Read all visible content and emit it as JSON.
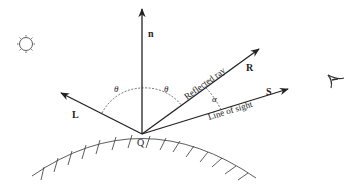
{
  "figure": {
    "labels": {
      "normal": "n",
      "light": "L",
      "reflected": "R",
      "sight": "S",
      "point": "Q",
      "theta_left": "θ",
      "theta_right": "θ",
      "alpha": "α",
      "reflected_ray_text": "Reflected ray",
      "line_of_sight_text": "Line of sight"
    },
    "icons": {
      "light_source": "sun-icon",
      "viewer": "eye-icon"
    },
    "colors": {
      "stroke": "#222222",
      "background": "#ffffff"
    }
  }
}
